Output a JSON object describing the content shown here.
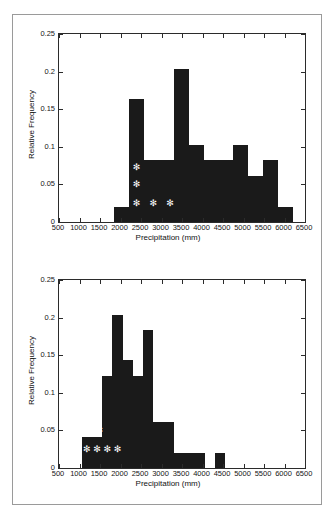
{
  "figure": {
    "title": "",
    "panels": [
      {
        "id": "top-histogram",
        "chart_index": 0
      },
      {
        "id": "bottom-histogram",
        "chart_index": 1
      }
    ]
  },
  "chart_data": [
    {
      "type": "bar",
      "id": "top-histogram",
      "title": "",
      "xlabel": "Precipitation (mm)",
      "ylabel": "Relative Frequency",
      "xlim": [
        500,
        6500
      ],
      "ylim": [
        0,
        0.25
      ],
      "xticks": [
        500,
        1000,
        1500,
        2000,
        2500,
        3000,
        3500,
        4000,
        4500,
        5000,
        5500,
        6000,
        6500
      ],
      "xticklabels": [
        "500",
        "1000",
        "1500",
        "2000",
        "2500",
        "3000",
        "3500",
        "4000",
        "4500",
        "5000",
        "5500",
        "6000",
        "6500"
      ],
      "yticks": [
        0,
        0.05,
        0.1,
        0.15,
        0.2,
        0.25
      ],
      "yticklabels": [
        "0",
        "0.05",
        "0.1",
        "0.15",
        "0.2",
        "0.25"
      ],
      "grid": false,
      "legend": null,
      "bar_color": "#1a1a1a",
      "bin_edges": [
        1850,
        2213,
        2575,
        2938,
        3300,
        3663,
        4025,
        4388,
        4750,
        5113,
        5475,
        5838,
        6200
      ],
      "values": [
        0.02,
        0.163,
        0.082,
        0.082,
        0.204,
        0.102,
        0.082,
        0.082,
        0.102,
        0.061,
        0.082,
        0.02
      ],
      "annotations": [
        {
          "marker": "asterisk",
          "x": 2390,
          "y": 0.0735,
          "color": "#ffffff"
        },
        {
          "marker": "asterisk",
          "x": 2390,
          "y": 0.05,
          "color": "#ffffff"
        },
        {
          "marker": "asterisk",
          "x": 2390,
          "y": 0.025,
          "color": "#ffffff"
        },
        {
          "marker": "asterisk",
          "x": 2800,
          "y": 0.025,
          "color": "#ffffff"
        },
        {
          "marker": "asterisk",
          "x": 3210,
          "y": 0.025,
          "color": "#ffffff"
        }
      ]
    },
    {
      "type": "bar",
      "id": "bottom-histogram",
      "title": "",
      "xlabel": "Precipitation (mm)",
      "ylabel": "Relative Frequency",
      "xlim": [
        500,
        6500
      ],
      "ylim": [
        0,
        0.25
      ],
      "xticks": [
        500,
        1000,
        1500,
        2000,
        2500,
        3000,
        3500,
        4000,
        4500,
        5000,
        5500,
        6000,
        6500
      ],
      "xticklabels": [
        "500",
        "1000",
        "1500",
        "2000",
        "2500",
        "3000",
        "3500",
        "4000",
        "4500",
        "5000",
        "5500",
        "6000",
        "6500"
      ],
      "yticks": [
        0,
        0.05,
        0.1,
        0.15,
        0.2,
        0.25
      ],
      "yticklabels": [
        "0",
        "0.05",
        "0.1",
        "0.15",
        "0.2",
        "0.25"
      ],
      "grid": false,
      "legend": null,
      "bar_color": "#1a1a1a",
      "bin_edges": [
        1050,
        1300,
        1550,
        1800,
        2050,
        2300,
        2550,
        2800,
        3050,
        3300,
        3550,
        3800,
        4050,
        4300,
        4550
      ],
      "values": [
        0.041,
        0.041,
        0.122,
        0.204,
        0.143,
        0.122,
        0.184,
        0.061,
        0.061,
        0.02,
        0.02,
        0.02,
        0.0,
        0.02
      ],
      "annotations": [
        {
          "marker": "asterisk",
          "x": 1480,
          "y": 0.05,
          "color": "#ffffff"
        },
        {
          "marker": "asterisk",
          "x": 1180,
          "y": 0.025,
          "color": "#ffffff"
        },
        {
          "marker": "asterisk",
          "x": 1430,
          "y": 0.025,
          "color": "#ffffff"
        },
        {
          "marker": "asterisk",
          "x": 1680,
          "y": 0.025,
          "color": "#ffffff"
        },
        {
          "marker": "asterisk",
          "x": 1930,
          "y": 0.025,
          "color": "#ffffff"
        }
      ]
    }
  ]
}
